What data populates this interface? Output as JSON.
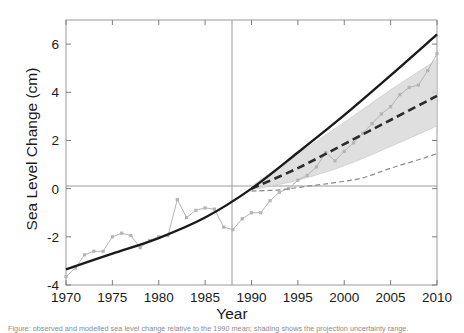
{
  "chart_data": {
    "type": "line",
    "title": "",
    "xlabel": "Year",
    "ylabel": "Sea Level Change (cm)",
    "xlim": [
      1970,
      2010
    ],
    "ylim": [
      -4,
      7
    ],
    "xticks": [
      1970,
      1975,
      1980,
      1985,
      1990,
      1995,
      2000,
      2005,
      2010
    ],
    "xticklabels": [
      "1970",
      "1975",
      "1980",
      "1985",
      "1990",
      "1995",
      "2000",
      "2005",
      "2010"
    ],
    "yticks": [
      -4,
      -2,
      0,
      2,
      4,
      6
    ],
    "yticklabels": [
      "-4",
      "-2",
      "0",
      "2",
      "4",
      "6"
    ],
    "grid": false,
    "legend": "none",
    "reference_lines": {
      "baseline_y": 0,
      "baseline_x": 1990
    },
    "series": [
      {
        "name": "Observations (tide gauge / altimetry)",
        "style": "thin-line-with-markers",
        "color": "#b4b4b4",
        "x": [
          1970,
          1971,
          1972,
          1973,
          1974,
          1975,
          1976,
          1977,
          1978,
          1979,
          1980,
          1981,
          1982,
          1983,
          1984,
          1985,
          1986,
          1987,
          1988,
          1989,
          1990,
          1991,
          1992,
          1993,
          1994,
          1995,
          1996,
          1997,
          1998,
          1999,
          2000,
          2001,
          2002,
          2003,
          2004,
          2005,
          2006,
          2007,
          2008,
          2009,
          2010
        ],
        "values": [
          -3.65,
          -3.3,
          -2.75,
          -2.6,
          -2.6,
          -2.0,
          -1.85,
          -1.95,
          -2.45,
          -2.15,
          -2.0,
          -1.95,
          -0.45,
          -1.2,
          -0.9,
          -0.8,
          -0.85,
          -1.6,
          -1.7,
          -1.25,
          -1.0,
          -1.0,
          -0.5,
          -0.15,
          0.0,
          0.35,
          0.55,
          0.9,
          1.5,
          1.15,
          1.55,
          1.9,
          2.3,
          2.7,
          3.1,
          3.4,
          3.9,
          4.2,
          4.3,
          4.9,
          5.6
        ]
      },
      {
        "name": "Model best estimate (solid thick)",
        "style": "thick-solid-line",
        "color": "#1a1a1a",
        "x": [
          1970,
          1975,
          1980,
          1985,
          1990,
          1995,
          2000,
          2005,
          2010
        ],
        "values": [
          -3.35,
          -2.7,
          -2.05,
          -1.2,
          0.0,
          1.5,
          3.05,
          4.7,
          6.4
        ]
      },
      {
        "name": "Scenario projection (dashed thick)",
        "style": "thick-dashed-line",
        "color": "#2b2b2b",
        "x": [
          1990,
          1995,
          2000,
          2005,
          2010
        ],
        "values": [
          0.0,
          0.85,
          1.85,
          2.85,
          3.85
        ],
        "band": {
          "name": "Uncertainty range",
          "color": "#d8d8d8",
          "upper": [
            0.1,
            1.45,
            2.75,
            4.1,
            5.35
          ],
          "lower": [
            -0.05,
            0.35,
            0.95,
            1.75,
            2.6
          ]
        }
      },
      {
        "name": "Low scenario (thin dashed)",
        "style": "thin-dashed-line",
        "color": "#8a8a8a",
        "x": [
          1990,
          1993,
          1996,
          1999,
          2002,
          2005,
          2008,
          2010
        ],
        "values": [
          -0.1,
          -0.05,
          0.1,
          0.25,
          0.45,
          0.85,
          1.2,
          1.45
        ]
      }
    ]
  },
  "axis": {
    "ylabel_text": "Sea Level Change (cm)",
    "xlabel_text": "Year"
  },
  "caption": {
    "text": "Figure:  observed and modelled sea level change relative to the 1990 mean; shading shows the projection uncertainty range."
  }
}
